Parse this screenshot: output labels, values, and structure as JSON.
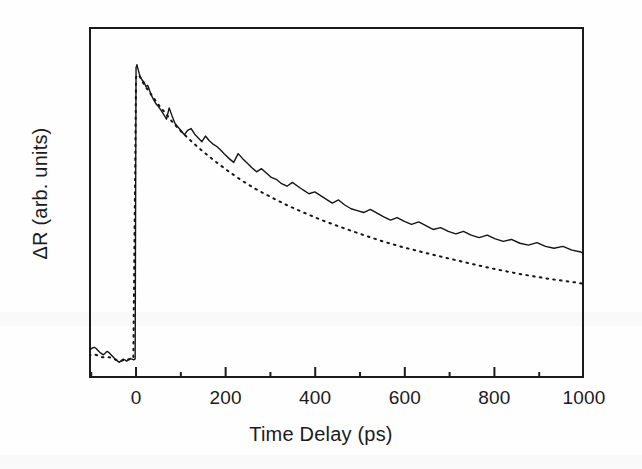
{
  "chart_data": {
    "type": "line",
    "title": "",
    "xlabel": "Time Delay (ps)",
    "ylabel": "ΔR (arb. units)",
    "xlim": [
      -105,
      1000
    ],
    "ylim": [
      0,
      1.12
    ],
    "grid": false,
    "legend": "none",
    "xticks_major": [
      0,
      200,
      400,
      600,
      800,
      1000
    ],
    "xticks_major_labels": [
      "0",
      "200",
      "400",
      "600",
      "800",
      "1000"
    ],
    "xticks_minor": [
      -100,
      100,
      300,
      500,
      700,
      900
    ],
    "yticks": [],
    "ytick_labels": [],
    "axis_frame": "box",
    "tick_direction": "in",
    "annotations": [],
    "series": [
      {
        "name": "measured transient reflectivity",
        "style": "solid",
        "color": "#141414",
        "linewidth": 1.4,
        "x": [
          -105,
          -101,
          -97,
          -93,
          -89,
          -85,
          -81,
          -77,
          -73,
          -69,
          -65,
          -61,
          -57,
          -53,
          -49,
          -45,
          -41,
          -37,
          -33,
          -29,
          -25,
          -21,
          -17,
          -13,
          -9,
          -5,
          -2,
          0,
          2,
          4,
          7,
          10,
          14,
          18,
          22,
          26,
          30,
          35,
          40,
          45,
          50,
          56,
          62,
          68,
          74,
          80,
          87,
          94,
          101,
          108,
          115,
          123,
          131,
          139,
          147,
          155,
          163,
          172,
          181,
          190,
          199,
          208,
          218,
          228,
          238,
          248,
          258,
          269,
          280,
          291,
          302,
          313,
          325,
          337,
          349,
          361,
          373,
          386,
          399,
          412,
          425,
          438,
          452,
          466,
          480,
          494,
          508,
          523,
          538,
          553,
          568,
          583,
          599,
          615,
          631,
          647,
          663,
          680,
          697,
          714,
          731,
          748,
          766,
          784,
          802,
          820,
          838,
          857,
          876,
          895,
          914,
          933,
          953,
          973,
          993,
          1000
        ],
        "y": [
          0.09,
          0.092,
          0.096,
          0.098,
          0.094,
          0.088,
          0.082,
          0.078,
          0.074,
          0.079,
          0.085,
          0.082,
          0.076,
          0.07,
          0.064,
          0.058,
          0.054,
          0.05,
          0.055,
          0.06,
          0.058,
          0.054,
          0.058,
          0.062,
          0.06,
          0.058,
          0.061,
          0.99,
          1.0,
          0.988,
          0.972,
          0.96,
          0.95,
          0.944,
          0.93,
          0.934,
          0.918,
          0.9,
          0.886,
          0.874,
          0.866,
          0.854,
          0.84,
          0.826,
          0.862,
          0.838,
          0.812,
          0.8,
          0.788,
          0.776,
          0.79,
          0.796,
          0.778,
          0.766,
          0.754,
          0.772,
          0.758,
          0.746,
          0.738,
          0.726,
          0.712,
          0.7,
          0.688,
          0.716,
          0.7,
          0.686,
          0.672,
          0.658,
          0.668,
          0.654,
          0.64,
          0.634,
          0.62,
          0.612,
          0.624,
          0.612,
          0.6,
          0.588,
          0.594,
          0.582,
          0.57,
          0.558,
          0.568,
          0.552,
          0.54,
          0.534,
          0.528,
          0.538,
          0.526,
          0.514,
          0.504,
          0.512,
          0.5,
          0.49,
          0.498,
          0.486,
          0.474,
          0.48,
          0.468,
          0.46,
          0.468,
          0.456,
          0.448,
          0.456,
          0.444,
          0.436,
          0.442,
          0.43,
          0.424,
          0.432,
          0.42,
          0.414,
          0.42,
          0.408,
          0.402,
          0.396
        ]
      },
      {
        "name": "fit / reference decay",
        "style": "dotted",
        "color": "#141414",
        "linewidth": 2.0,
        "x": [
          -105,
          -95,
          -85,
          -75,
          -65,
          -55,
          -45,
          -35,
          -25,
          -15,
          -6,
          0,
          6,
          14,
          24,
          36,
          50,
          66,
          84,
          104,
          126,
          150,
          176,
          204,
          234,
          266,
          300,
          336,
          374,
          414,
          456,
          500,
          546,
          594,
          644,
          696,
          750,
          806,
          864,
          924,
          986,
          1000
        ],
        "y": [
          0.072,
          0.076,
          0.072,
          0.066,
          0.068,
          0.064,
          0.058,
          0.054,
          0.058,
          0.06,
          0.062,
          0.96,
          0.968,
          0.946,
          0.924,
          0.9,
          0.872,
          0.844,
          0.812,
          0.782,
          0.752,
          0.722,
          0.692,
          0.662,
          0.632,
          0.604,
          0.578,
          0.552,
          0.528,
          0.504,
          0.482,
          0.46,
          0.438,
          0.418,
          0.4,
          0.382,
          0.364,
          0.346,
          0.33,
          0.316,
          0.304,
          0.3
        ]
      }
    ]
  },
  "axis": {
    "x_title": "Time Delay (ps)",
    "y_title": "ΔR (arb. units)",
    "tick_labels": [
      "0",
      "200",
      "400",
      "600",
      "800",
      "1000"
    ]
  }
}
